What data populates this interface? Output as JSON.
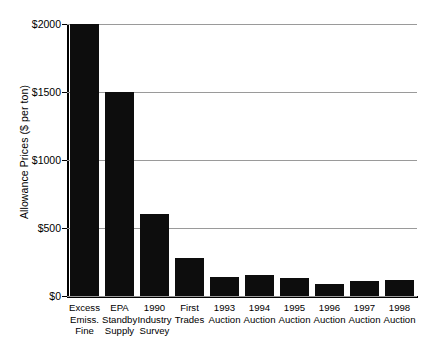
{
  "chart_data": {
    "type": "bar",
    "title": "",
    "subtitle": "",
    "xlabel": "",
    "ylabel": "Allowance Prices ($ per ton)",
    "ylim": [
      0,
      2000
    ],
    "ytick_labels": [
      "$0",
      "$500",
      "$1000",
      "$1500",
      "$2000"
    ],
    "ytick_values": [
      0,
      500,
      1000,
      1500,
      2000
    ],
    "grid": true,
    "legend": false,
    "bar_color": "#0d0d0d",
    "gridline_color": "#9a9a9a",
    "axis_color": "#000000",
    "categories": [
      "Excess\nEmiss.\nFine",
      "EPA\nStandby\nSupply",
      "1990\nIndustry\nSurvey",
      "First\nTrades",
      "1993\nAuction",
      "1994\nAuction",
      "1995\nAuction",
      "1996\nAuction",
      "1997\nAuction",
      "1998\nAuction"
    ],
    "values": [
      2000,
      1500,
      600,
      280,
      140,
      155,
      135,
      90,
      110,
      120
    ]
  }
}
